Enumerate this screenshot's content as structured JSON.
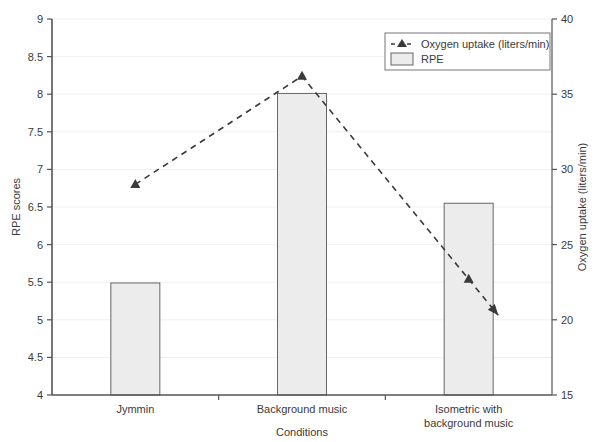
{
  "chart_data": {
    "type": "bar",
    "title": "",
    "subtitle": "",
    "categories": [
      "Jymmin",
      "Background music",
      "Isometric with background music"
    ],
    "category_lines": [
      [
        "Jymmin"
      ],
      [
        "Background music"
      ],
      [
        "Isometric with",
        "background music"
      ]
    ],
    "xlabel": "Conditions",
    "ylabel": "RPE scores",
    "y2label": "Oxygen uptake (liters/min)",
    "ylim": [
      4,
      9
    ],
    "yticks": [
      4,
      4.5,
      5,
      5.5,
      6,
      6.5,
      7,
      7.5,
      8,
      8.5,
      9
    ],
    "ytick_labels": [
      "4",
      "4.5",
      "5",
      "5.5",
      "6",
      "6.5",
      "7",
      "7.5",
      "8",
      "8.5",
      "9"
    ],
    "y2lim": [
      15,
      40
    ],
    "y2ticks": [
      15,
      20,
      25,
      30,
      35,
      40
    ],
    "y2tick_labels": [
      "15",
      "20",
      "25",
      "30",
      "35",
      "40"
    ],
    "grid": true,
    "grid_axis": "y",
    "legend_position": "top-right",
    "series": [
      {
        "name": "RPE",
        "kind": "bar",
        "axis": "left",
        "values": [
          5.49,
          8.01,
          6.55
        ],
        "fill": "#ececec",
        "stroke": "#666666"
      },
      {
        "name": "Oxygen uptake (liters/min)",
        "kind": "line",
        "axis": "right",
        "style": "dashed",
        "marker": "triangle",
        "arrow_end": true,
        "values": [
          29.0,
          36.2,
          22.7
        ],
        "arrow_tip_value": 20.3,
        "stroke": "#3a3a3a"
      }
    ]
  },
  "legend": {
    "items": [
      {
        "label": "Oxygen uptake (liters/min)",
        "type": "dashed-marker"
      },
      {
        "label": "RPE",
        "type": "swatch"
      }
    ]
  },
  "colors": {
    "bar_fill": "#ececec",
    "bar_stroke": "#666666",
    "line": "#3a3a3a",
    "axis": "#555555",
    "grid": "#f0f0f0",
    "text": "#3a3a3a",
    "background": "#ffffff"
  }
}
